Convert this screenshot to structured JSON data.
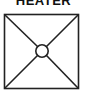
{
  "symbol": {
    "title": "HEATER",
    "subtitle": "",
    "icon": "heater-symbol-icon",
    "stroke_color": "#222222",
    "background": "#ffffff"
  }
}
